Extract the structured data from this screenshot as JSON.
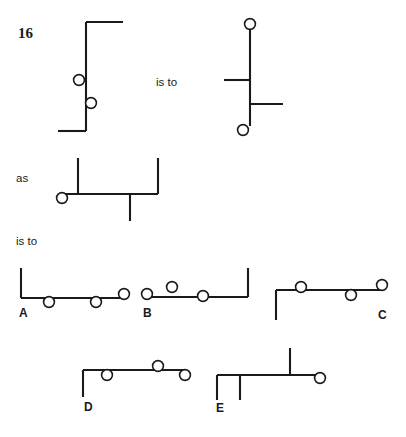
{
  "page": {
    "question_number": "16",
    "background_color": "#ffffff",
    "line_color": "#1a1a1a",
    "node_fill_color": "#ffffff",
    "width": 406,
    "height": 437
  },
  "relations": {
    "is_to_1": "is to",
    "as": "as",
    "is_to_2": "is to"
  },
  "prompt_pair": {
    "left_figure": {
      "name": "figure-A-prompt",
      "segments": [
        {
          "x1": 86,
          "y1": 22,
          "x2": 86,
          "y2": 131
        },
        {
          "x1": 86,
          "y1": 22,
          "x2": 123,
          "y2": 22
        },
        {
          "x1": 58,
          "y1": 131,
          "x2": 86,
          "y2": 131
        }
      ],
      "nodes": [
        {
          "cx": 79,
          "cy": 80,
          "r": 5.4
        },
        {
          "cx": 91,
          "cy": 103,
          "r": 5.4
        }
      ]
    },
    "right_figure": {
      "name": "figure-B-prompt",
      "segments": [
        {
          "x1": 250,
          "y1": 28,
          "x2": 250,
          "y2": 126
        },
        {
          "x1": 224,
          "y1": 80,
          "x2": 250,
          "y2": 80
        },
        {
          "x1": 250,
          "y1": 104,
          "x2": 283,
          "y2": 104
        }
      ],
      "nodes": [
        {
          "cx": 250,
          "cy": 24,
          "r": 5.4
        },
        {
          "cx": 243,
          "cy": 130,
          "r": 5.4
        }
      ]
    }
  },
  "analogy_figure": {
    "name": "figure-C-prompt",
    "segments": [
      {
        "x1": 64,
        "y1": 194,
        "x2": 158,
        "y2": 194
      },
      {
        "x1": 78,
        "y1": 158,
        "x2": 78,
        "y2": 194
      },
      {
        "x1": 158,
        "y1": 158,
        "x2": 158,
        "y2": 194
      },
      {
        "x1": 130,
        "y1": 194,
        "x2": 130,
        "y2": 221
      }
    ],
    "nodes": [
      {
        "cx": 62,
        "cy": 198,
        "r": 5.4
      }
    ]
  },
  "options": [
    {
      "label": "A",
      "name": "option-a",
      "label_x": 19,
      "label_y": 317,
      "segments": [
        {
          "x1": 21,
          "y1": 268,
          "x2": 21,
          "y2": 298
        },
        {
          "x1": 21,
          "y1": 298,
          "x2": 122,
          "y2": 298
        }
      ],
      "nodes": [
        {
          "cx": 49,
          "cy": 302,
          "r": 5.4
        },
        {
          "cx": 96,
          "cy": 302,
          "r": 5.4
        },
        {
          "cx": 124,
          "cy": 294,
          "r": 5.4
        }
      ]
    },
    {
      "label": "B",
      "name": "option-b",
      "label_x": 143,
      "label_y": 317,
      "segments": [
        {
          "x1": 146,
          "y1": 297,
          "x2": 248,
          "y2": 297
        },
        {
          "x1": 248,
          "y1": 268,
          "x2": 248,
          "y2": 297
        }
      ],
      "nodes": [
        {
          "cx": 147,
          "cy": 294,
          "r": 5.4
        },
        {
          "cx": 172,
          "cy": 287,
          "r": 5.4
        },
        {
          "cx": 203,
          "cy": 296,
          "r": 5.4
        }
      ]
    },
    {
      "label": "C",
      "name": "option-c",
      "label_x": 378,
      "label_y": 319,
      "segments": [
        {
          "x1": 276,
          "y1": 290,
          "x2": 276,
          "y2": 320
        },
        {
          "x1": 276,
          "y1": 290,
          "x2": 382,
          "y2": 290
        }
      ],
      "nodes": [
        {
          "cx": 301,
          "cy": 287,
          "r": 5.4
        },
        {
          "cx": 351,
          "cy": 295,
          "r": 5.4
        },
        {
          "cx": 382,
          "cy": 285,
          "r": 5.4
        }
      ]
    },
    {
      "label": "D",
      "name": "option-d",
      "label_x": 84,
      "label_y": 411,
      "segments": [
        {
          "x1": 83,
          "y1": 370,
          "x2": 83,
          "y2": 397
        },
        {
          "x1": 83,
          "y1": 370,
          "x2": 185,
          "y2": 370
        }
      ],
      "nodes": [
        {
          "cx": 107,
          "cy": 375,
          "r": 5.4
        },
        {
          "cx": 158,
          "cy": 366,
          "r": 5.4
        },
        {
          "cx": 185,
          "cy": 375,
          "r": 5.4
        }
      ]
    },
    {
      "label": "E",
      "name": "option-e",
      "label_x": 216,
      "label_y": 412,
      "segments": [
        {
          "x1": 217,
          "y1": 375,
          "x2": 317,
          "y2": 375
        },
        {
          "x1": 217,
          "y1": 375,
          "x2": 217,
          "y2": 400
        },
        {
          "x1": 240,
          "y1": 375,
          "x2": 240,
          "y2": 400
        },
        {
          "x1": 290,
          "y1": 348,
          "x2": 290,
          "y2": 375
        }
      ],
      "nodes": [
        {
          "cx": 320,
          "cy": 378,
          "r": 5.4
        }
      ]
    }
  ],
  "text_positions": {
    "question_number": {
      "x": 18,
      "y": 38
    },
    "is_to_1": {
      "x": 156,
      "y": 86
    },
    "as": {
      "x": 16,
      "y": 182
    },
    "is_to_2": {
      "x": 16,
      "y": 245
    }
  }
}
